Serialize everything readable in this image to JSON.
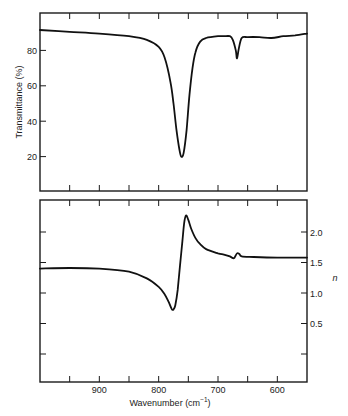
{
  "chart_data": [
    {
      "type": "line",
      "panel": "top",
      "title": "",
      "xlabel": "",
      "ylabel": "Transmittance (%)",
      "xlim": [
        1000,
        550
      ],
      "ylim": [
        0,
        100
      ],
      "yticks": [
        20,
        40,
        60,
        80
      ],
      "ytick_labels": [
        "20",
        "40",
        "60",
        "80"
      ],
      "xticks": [
        950,
        900,
        850,
        800,
        750,
        700,
        650,
        600
      ],
      "xtick_labels": [],
      "grid": false,
      "series": [
        {
          "name": "Transmittance",
          "x": [
            1000,
            950,
            900,
            850,
            820,
            800,
            790,
            780,
            775,
            770,
            765,
            762,
            758,
            753,
            748,
            743,
            738,
            730,
            720,
            700,
            690,
            680,
            675,
            670,
            668,
            665,
            660,
            650,
            630,
            610,
            590,
            570,
            550
          ],
          "y": [
            91.5,
            90.5,
            89.5,
            88,
            86,
            82,
            76,
            62,
            50,
            35,
            24,
            20,
            22,
            35,
            55,
            70,
            79,
            85,
            87,
            88,
            88,
            88,
            86,
            80,
            75.5,
            81,
            87,
            87.5,
            87.5,
            87,
            88,
            88.5,
            89.5
          ]
        }
      ]
    },
    {
      "type": "line",
      "panel": "bottom",
      "title": "",
      "xlabel": "Wavenumber (cm⁻¹)",
      "ylabel": "n",
      "xlim": [
        1000,
        550
      ],
      "ylim": [
        -0.47,
        2.44
      ],
      "yticks": [
        0.0,
        0.5,
        1.0,
        1.5,
        2.0
      ],
      "ytick_labels": [
        "",
        "0.5",
        "1.0",
        "1.5",
        "2.0"
      ],
      "xticks": [
        950,
        900,
        850,
        800,
        750,
        700,
        650,
        600
      ],
      "xtick_labels": [
        "",
        "900",
        "",
        "800",
        "",
        "700",
        "",
        "600"
      ],
      "grid": false,
      "series": [
        {
          "name": "Refractive index n",
          "x": [
            1000,
            950,
            900,
            850,
            820,
            800,
            790,
            783,
            778,
            775,
            772,
            768,
            764,
            760,
            757,
            754,
            750,
            745,
            738,
            730,
            720,
            700,
            690,
            680,
            675,
            672,
            668,
            664,
            660,
            640,
            600,
            550
          ],
          "y": [
            1.4,
            1.41,
            1.4,
            1.35,
            1.24,
            1.1,
            0.98,
            0.85,
            0.74,
            0.73,
            0.8,
            1.05,
            1.45,
            1.85,
            2.15,
            2.27,
            2.2,
            2.05,
            1.9,
            1.8,
            1.72,
            1.65,
            1.63,
            1.6,
            1.57,
            1.58,
            1.65,
            1.64,
            1.6,
            1.59,
            1.58,
            1.58
          ]
        }
      ]
    }
  ],
  "labels": {
    "top_ylabel": "Transmittance  (%)",
    "bottom_ylabel": "n",
    "xlabel": "Wavenumber  (cm",
    "xlabel_sup": "−1",
    "xlabel_close": ")"
  }
}
